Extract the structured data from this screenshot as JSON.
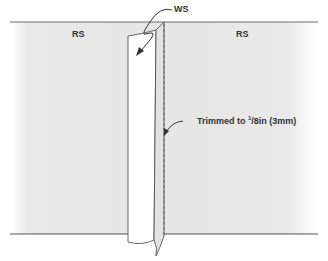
{
  "diagram": {
    "labels": {
      "rs_left": "RS",
      "rs_right": "RS",
      "ws": "WS",
      "trimmed_prefix": "Trimmed to ",
      "trimmed_fraction_num": "1",
      "trimmed_fraction_rest": "/8in (3mm)"
    },
    "colors": {
      "fabric": "#e6e6e6",
      "strip": "#ffffff",
      "line": "#555555",
      "text": "#333333"
    }
  }
}
